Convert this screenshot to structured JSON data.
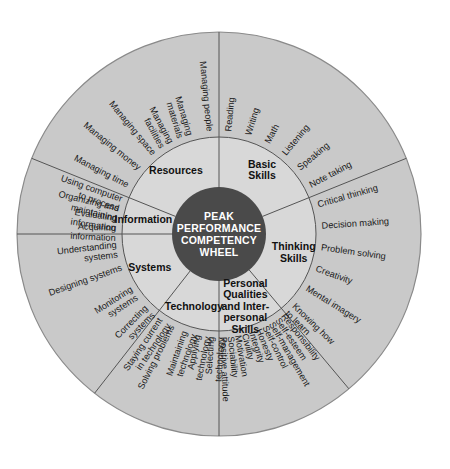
{
  "diagram": {
    "hub_lines": [
      "PEAK",
      "PERFORMANCE",
      "COMPETENCY",
      "WHEEL"
    ],
    "colors": {
      "background": "#ffffff",
      "hub": "#4a4a4a",
      "hub_text": "#ffffff",
      "middle_ring": "#d8d8d8",
      "outer_ring": "#c9c9c9",
      "divider": "#555555",
      "text": "#1a1a1a"
    },
    "sectors": [
      {
        "id": "basic-skills",
        "label_lines": [
          "Basic",
          "Skills"
        ],
        "items": [
          "Reading",
          "Writing",
          "Math",
          "Listening",
          "Speaking",
          "Note taking"
        ]
      },
      {
        "id": "thinking-skills",
        "label_lines": [
          "Thinking",
          "Skills"
        ],
        "items": [
          "Critical thinking",
          "Decision making",
          "Problem solving",
          "Creativity",
          "Mental imagery",
          "Knowing how to learn"
        ]
      },
      {
        "id": "personal-qualities",
        "label_lines": [
          "Personal",
          "Qualities",
          "and Inter-",
          "personal",
          "Skills"
        ],
        "items": [
          "Responsibility",
          "Self-esteem",
          "Self-management",
          "Self-control",
          "Honesty",
          "Integrity",
          "Civility",
          "Motivation",
          "Sociability",
          "Positive attitude"
        ]
      },
      {
        "id": "technology",
        "label_lines": [
          "Technology"
        ],
        "items": [
          "Selecting technology",
          "Applying technology",
          "Maintaining technology",
          "Solving problems",
          "Staying current in technology"
        ]
      },
      {
        "id": "systems",
        "label_lines": [
          "Systems"
        ],
        "items": [
          "Correcting systems",
          "Monitoring systems",
          "Designing systems",
          "Understanding systems"
        ]
      },
      {
        "id": "information",
        "label_lines": [
          "Information"
        ],
        "items": [
          "Acquiring information",
          "Evaluating information",
          "Organizing and maintaining",
          "Using computer to process"
        ]
      },
      {
        "id": "resources",
        "label_lines": [
          "Resources"
        ],
        "items": [
          "Managing time",
          "Managing money",
          "Managing space",
          "Managing facilities",
          "Managing materials",
          "Managing people"
        ]
      }
    ],
    "geometry": {
      "center_x": 219,
      "center_y": 234,
      "radius_outer": 202,
      "radius_middle": 97,
      "radius_hub": 47
    }
  }
}
